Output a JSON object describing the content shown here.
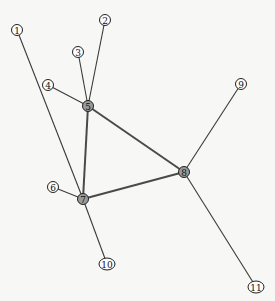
{
  "graph": {
    "type": "undirected",
    "nodes": [
      {
        "id": "1",
        "label": "1",
        "x": 17,
        "y": 30,
        "kind": "leaf"
      },
      {
        "id": "2",
        "label": "2",
        "x": 105,
        "y": 20,
        "kind": "leaf"
      },
      {
        "id": "3",
        "label": "3",
        "x": 78,
        "y": 52,
        "kind": "leaf"
      },
      {
        "id": "4",
        "label": "4",
        "x": 48,
        "y": 85,
        "kind": "leaf"
      },
      {
        "id": "5",
        "label": "5",
        "x": 88,
        "y": 106,
        "kind": "hub"
      },
      {
        "id": "6",
        "label": "6",
        "x": 53,
        "y": 187,
        "kind": "leaf"
      },
      {
        "id": "7",
        "label": "7",
        "x": 83,
        "y": 199,
        "kind": "hub"
      },
      {
        "id": "8",
        "label": "8",
        "x": 184,
        "y": 172,
        "kind": "hub"
      },
      {
        "id": "9",
        "label": "9",
        "x": 241,
        "y": 84,
        "kind": "leaf"
      },
      {
        "id": "10",
        "label": "10",
        "x": 107,
        "y": 264,
        "kind": "leaf"
      },
      {
        "id": "11",
        "label": "11",
        "x": 256,
        "y": 287,
        "kind": "leaf"
      }
    ],
    "edges": [
      {
        "source": "1",
        "target": "7",
        "weight": "thin"
      },
      {
        "source": "2",
        "target": "5",
        "weight": "thin"
      },
      {
        "source": "3",
        "target": "5",
        "weight": "thin"
      },
      {
        "source": "4",
        "target": "5",
        "weight": "thin"
      },
      {
        "source": "5",
        "target": "7",
        "weight": "thick"
      },
      {
        "source": "5",
        "target": "8",
        "weight": "thick"
      },
      {
        "source": "7",
        "target": "8",
        "weight": "thick"
      },
      {
        "source": "6",
        "target": "7",
        "weight": "thin"
      },
      {
        "source": "7",
        "target": "10",
        "weight": "thin"
      },
      {
        "source": "8",
        "target": "9",
        "weight": "thin"
      },
      {
        "source": "8",
        "target": "11",
        "weight": "thin"
      }
    ],
    "colors": {
      "background": "#f7f7f5",
      "edge": "#3a3a3a",
      "hub_fill": "#9a9a9a",
      "leaf_fill": "#fdfdfd"
    }
  }
}
